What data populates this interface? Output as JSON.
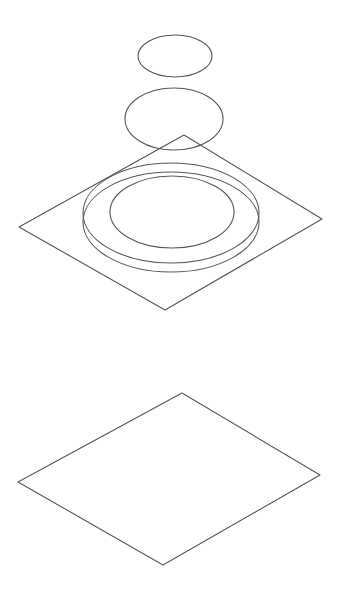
{
  "diagram": {
    "type": "isometric-exploded-view",
    "stroke_color": "#555555",
    "background": "#ffffff",
    "ellipses": [
      {
        "name": "top-disc",
        "cx": 175,
        "cy": 56,
        "rx": 37,
        "ry": 21
      },
      {
        "name": "middle-disc",
        "cx": 174,
        "cy": 119,
        "rx": 49,
        "ry": 31
      },
      {
        "name": "ring-outer-top",
        "cx": 171,
        "cy": 213,
        "rx": 88,
        "ry": 50
      },
      {
        "name": "ring-outer-bottom",
        "cx": 171,
        "cy": 222,
        "rx": 88,
        "ry": 50
      },
      {
        "name": "ring-inner",
        "cx": 172,
        "cy": 212,
        "rx": 62,
        "ry": 36
      }
    ],
    "planes": [
      {
        "name": "upper-plate",
        "points": "184,135 322,219 165,310 19,227"
      },
      {
        "name": "lower-plate",
        "points": "182,393 320,475 163,565 18,482"
      }
    ]
  }
}
